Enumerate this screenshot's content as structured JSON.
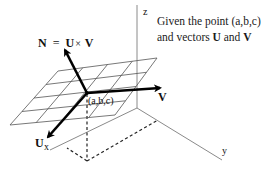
{
  "diagram": {
    "equation": {
      "lhs": "N",
      "eq": "=",
      "u": "U",
      "times": "×",
      "v": "V"
    },
    "caption": {
      "line1": "Given the point  (a,b,c)",
      "line2_prefix": "and vectors ",
      "u": "U",
      "and": " and ",
      "v": "V"
    },
    "axes": {
      "x_label": "x",
      "y_label": "y",
      "z_label": "z"
    },
    "point_label": "(a,b,c)",
    "vectors": {
      "u_label": "U",
      "v_label": "V",
      "n_label": "N"
    },
    "colors": {
      "axis": "#888888",
      "grid": "#555555",
      "vector": "#000000",
      "dashed": "#222222",
      "text": "#111111"
    }
  }
}
